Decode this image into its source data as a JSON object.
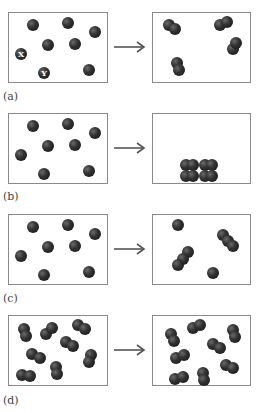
{
  "panels": [
    {
      "id": "a",
      "label": "(a)",
      "top": 12,
      "label_top": 90,
      "description": "Individual atoms combine into diatomic molecules",
      "left_particles": [
        {
          "x": 24,
          "y": 12
        },
        {
          "x": 59,
          "y": 10
        },
        {
          "x": 86,
          "y": 19
        },
        {
          "x": 39,
          "y": 32
        },
        {
          "x": 66,
          "y": 31
        },
        {
          "x": 12,
          "y": 41,
          "text": "X"
        },
        {
          "x": 35,
          "y": 60,
          "text": "Y"
        },
        {
          "x": 80,
          "y": 57
        }
      ],
      "right_particles": [
        [
          {
            "x": 16,
            "y": 12
          },
          {
            "x": 22,
            "y": 16
          }
        ],
        [
          {
            "x": 67,
            "y": 12
          },
          {
            "x": 74,
            "y": 9
          }
        ],
        [
          {
            "x": 80,
            "y": 36
          },
          {
            "x": 83,
            "y": 30
          }
        ],
        [
          {
            "x": 24,
            "y": 50
          },
          {
            "x": 26,
            "y": 57
          }
        ]
      ]
    },
    {
      "id": "b",
      "label": "(b)",
      "top": 113,
      "label_top": 190,
      "description": "Gas atoms condense into a compact solid block",
      "left_particles": [
        {
          "x": 24,
          "y": 12
        },
        {
          "x": 59,
          "y": 10
        },
        {
          "x": 86,
          "y": 19
        },
        {
          "x": 39,
          "y": 32
        },
        {
          "x": 66,
          "y": 31
        },
        {
          "x": 12,
          "y": 41
        },
        {
          "x": 35,
          "y": 60
        },
        {
          "x": 80,
          "y": 57
        }
      ],
      "right_particles": [
        [
          {
            "x": 33,
            "y": 51
          },
          {
            "x": 40,
            "y": 51
          },
          {
            "x": 33,
            "y": 62
          },
          {
            "x": 40,
            "y": 62
          }
        ],
        [
          {
            "x": 52,
            "y": 51
          },
          {
            "x": 59,
            "y": 51
          },
          {
            "x": 52,
            "y": 62
          },
          {
            "x": 59,
            "y": 62
          }
        ]
      ]
    },
    {
      "id": "c",
      "label": "(c)",
      "top": 214,
      "label_top": 292,
      "description": "Atoms combine into triatomic molecules with two remaining single atoms",
      "left_particles": [
        {
          "x": 24,
          "y": 12
        },
        {
          "x": 59,
          "y": 10
        },
        {
          "x": 86,
          "y": 19
        },
        {
          "x": 39,
          "y": 32
        },
        {
          "x": 66,
          "y": 31
        },
        {
          "x": 12,
          "y": 41
        },
        {
          "x": 35,
          "y": 60
        },
        {
          "x": 80,
          "y": 57
        }
      ],
      "right_particles": [
        [
          {
            "x": 25,
            "y": 10
          }
        ],
        [
          {
            "x": 35,
            "y": 37
          },
          {
            "x": 30,
            "y": 44
          },
          {
            "x": 25,
            "y": 50
          }
        ],
        [
          {
            "x": 70,
            "y": 20
          },
          {
            "x": 75,
            "y": 26
          },
          {
            "x": 80,
            "y": 31
          }
        ],
        [
          {
            "x": 60,
            "y": 58
          }
        ]
      ]
    },
    {
      "id": "d",
      "label": "(d)",
      "top": 315,
      "label_top": 394,
      "description": "Diatomic molecules rearranged, unchanged in composition",
      "left_particles": [
        [
          {
            "x": 15,
            "y": 13
          },
          {
            "x": 17,
            "y": 20
          }
        ],
        [
          {
            "x": 37,
            "y": 18
          },
          {
            "x": 43,
            "y": 12
          }
        ],
        [
          {
            "x": 69,
            "y": 9
          },
          {
            "x": 76,
            "y": 13
          }
        ],
        [
          {
            "x": 57,
            "y": 26
          },
          {
            "x": 64,
            "y": 30
          }
        ],
        [
          {
            "x": 23,
            "y": 38
          },
          {
            "x": 31,
            "y": 42
          }
        ],
        [
          {
            "x": 82,
            "y": 39
          },
          {
            "x": 80,
            "y": 46
          }
        ],
        [
          {
            "x": 47,
            "y": 51
          },
          {
            "x": 48,
            "y": 58
          }
        ],
        [
          {
            "x": 13,
            "y": 59
          },
          {
            "x": 21,
            "y": 60
          }
        ]
      ],
      "right_particles": [
        [
          {
            "x": 18,
            "y": 18
          },
          {
            "x": 21,
            "y": 25
          }
        ],
        [
          {
            "x": 40,
            "y": 12
          },
          {
            "x": 47,
            "y": 9
          }
        ],
        [
          {
            "x": 80,
            "y": 14
          },
          {
            "x": 82,
            "y": 21
          }
        ],
        [
          {
            "x": 60,
            "y": 28
          },
          {
            "x": 67,
            "y": 32
          }
        ],
        [
          {
            "x": 23,
            "y": 42
          },
          {
            "x": 31,
            "y": 39
          }
        ],
        [
          {
            "x": 73,
            "y": 49
          },
          {
            "x": 80,
            "y": 52
          }
        ],
        [
          {
            "x": 22,
            "y": 63
          },
          {
            "x": 30,
            "y": 61
          }
        ],
        [
          {
            "x": 50,
            "y": 57
          },
          {
            "x": 51,
            "y": 64
          }
        ]
      ]
    }
  ],
  "colors": {
    "atom": "#222222",
    "border": "#8a8a8a",
    "arrow": "#555555",
    "label": "#444444"
  }
}
